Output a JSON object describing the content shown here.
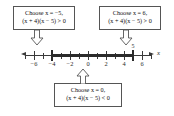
{
  "figure": {
    "axis_variable": "x",
    "callouts": [
      {
        "id": "left",
        "line1": "Choose x = −5,",
        "line2": "(x + 4)(x − 5) > 0"
      },
      {
        "id": "right",
        "line1": "Choose x = 6,",
        "line2": "(x + 4)(x − 5) > 0"
      },
      {
        "id": "mid",
        "line1": "Choose x = 0,",
        "line2": "(x + 4)(x − 5) < 0"
      }
    ],
    "arrows": [
      {
        "id": "arrow-left",
        "direction": "down",
        "points_to": "−5"
      },
      {
        "id": "arrow-right",
        "direction": "down",
        "points_to": "6"
      },
      {
        "id": "arrow-mid",
        "direction": "up",
        "points_to": "0"
      }
    ]
  },
  "chart_data": {
    "type": "number-line",
    "title": "",
    "xlabel": "x",
    "ylabel": "",
    "xlim": [
      -7,
      7
    ],
    "major_ticks": [
      -6,
      -4,
      -2,
      0,
      2,
      4,
      6
    ],
    "major_tick_labels": [
      "−6",
      "−4",
      "−2",
      "0",
      "2",
      "4",
      "6"
    ],
    "minor_ticks": [
      -7,
      -5,
      -3,
      -1,
      1,
      3,
      5,
      7
    ],
    "grid": false,
    "legend": null,
    "intervals": [
      {
        "label": "5",
        "start": -4,
        "end": 5,
        "endpoint_style": "bar",
        "emphasis": "heavy",
        "annotation_above_end": "5"
      }
    ],
    "test_points": [
      {
        "x": -5,
        "expression": "(x + 4)(x − 5)",
        "sign": ">",
        "value_side": "0"
      },
      {
        "x": 0,
        "expression": "(x + 4)(x − 5)",
        "sign": "<",
        "value_side": "0"
      },
      {
        "x": 6,
        "expression": "(x + 4)(x − 5)",
        "sign": ">",
        "value_side": "0"
      }
    ],
    "colors": {
      "axis": "#3a3a3a",
      "band": "#2b2b2b",
      "box_border": "#555555",
      "background": "#ffffff"
    }
  }
}
